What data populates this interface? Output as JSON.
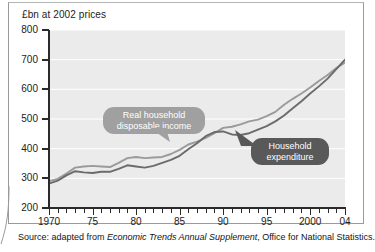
{
  "figure": {
    "source_prefix": "Source:  adapted from ",
    "source_italic": "Economic Trends Annual Supplement",
    "source_suffix": ", Office for National Statistics."
  },
  "callouts": {
    "income": "Real household\ndisposable income",
    "expenditure": "Household\nexpenditure"
  },
  "colors": {
    "plot_background": "#ebebeb",
    "gridline": "#ffffff",
    "axis": "#2b2b2b",
    "series_income": "#9a9a9a",
    "series_expenditure": "#6b6b6b",
    "callout_light": "#a0a0a0",
    "callout_dark": "#595959"
  },
  "chart_data": {
    "type": "line",
    "title": "",
    "subtitle": "",
    "ylabel": "£bn at 2002 prices",
    "xlabel": "",
    "ylim": [
      200,
      800
    ],
    "xlim": [
      1970,
      2004
    ],
    "yticks": [
      800,
      700,
      600,
      500,
      400,
      300,
      200
    ],
    "ytick_labels": [
      "800",
      "700",
      "600",
      "500",
      "400",
      "300",
      "200"
    ],
    "xticks": [
      1970,
      1975,
      1980,
      1985,
      1990,
      1995,
      2000,
      2004
    ],
    "xtick_labels": [
      "1970",
      "75",
      "80",
      "85",
      "90",
      "95",
      "2000",
      "04"
    ],
    "minor_xticks_every": 1,
    "grid": "horizontal",
    "legend": "annotated-callouts",
    "x": [
      1970,
      1971,
      1972,
      1973,
      1974,
      1975,
      1976,
      1977,
      1978,
      1979,
      1980,
      1981,
      1982,
      1983,
      1984,
      1985,
      1986,
      1987,
      1988,
      1989,
      1990,
      1991,
      1992,
      1993,
      1994,
      1995,
      1996,
      1997,
      1998,
      1999,
      2000,
      2001,
      2002,
      2003,
      2004
    ],
    "series": [
      {
        "name": "Real household disposable income",
        "color": "#9a9a9a",
        "values": [
          290,
          298,
          316,
          336,
          340,
          342,
          340,
          338,
          352,
          368,
          372,
          368,
          370,
          372,
          382,
          396,
          414,
          424,
          436,
          452,
          470,
          474,
          482,
          492,
          498,
          510,
          524,
          548,
          568,
          586,
          606,
          628,
          648,
          672,
          690
        ]
      },
      {
        "name": "Household expenditure",
        "color": "#6b6b6b",
        "values": [
          282,
          292,
          310,
          324,
          320,
          318,
          322,
          322,
          332,
          344,
          340,
          336,
          342,
          352,
          362,
          376,
          398,
          418,
          442,
          456,
          458,
          448,
          446,
          452,
          464,
          476,
          492,
          512,
          536,
          560,
          586,
          610,
          636,
          668,
          700
        ]
      }
    ],
    "annotations": [
      {
        "text": "Real household disposable income",
        "style": "callout-light",
        "points_to_year": 1989
      },
      {
        "text": "Household expenditure",
        "style": "callout-dark",
        "points_to_year": 1993
      }
    ]
  }
}
